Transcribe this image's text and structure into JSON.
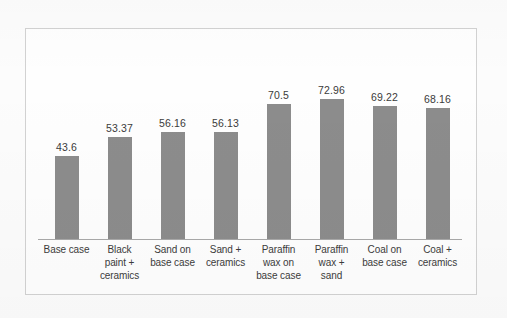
{
  "chart_data": {
    "type": "bar",
    "title": "",
    "subtitle": "",
    "xlabel": "",
    "ylabel": "",
    "grid": false,
    "legend": "none",
    "ylim": [
      0,
      80
    ],
    "categories": [
      "Base case",
      "Black paint + ceramics",
      "Sand on base case",
      "Sand + ceramics",
      "Paraffin wax on base case",
      "Paraffin wax + sand",
      "Coal on base case",
      "Coal + ceramics"
    ],
    "category_lines": [
      [
        "Base case"
      ],
      [
        "Black",
        "paint +",
        "ceramics"
      ],
      [
        "Sand on",
        "base case"
      ],
      [
        "Sand +",
        "ceramics"
      ],
      [
        "Paraffin",
        "wax on",
        "base case"
      ],
      [
        "Paraffin",
        "wax +",
        "sand"
      ],
      [
        "Coal on",
        "base case"
      ],
      [
        "Coal +",
        "ceramics"
      ]
    ],
    "values": [
      43.6,
      53.37,
      56.16,
      56.13,
      70.5,
      72.96,
      69.22,
      68.16
    ],
    "value_labels": [
      "43.6",
      "53.37",
      "56.16",
      "56.13",
      "70.5",
      "72.96",
      "69.22",
      "68.16"
    ],
    "bar_color": "#8c8c8c",
    "axis_color": "#a9a9a9",
    "frame_color": "#d2d2d2",
    "background_color": "#fefefe"
  }
}
